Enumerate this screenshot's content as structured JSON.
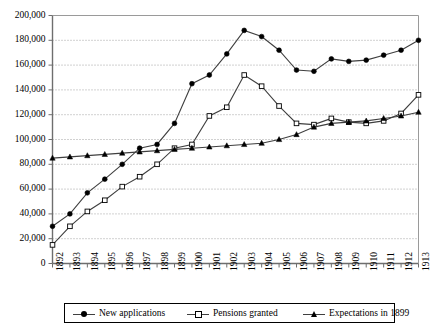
{
  "chart_data": {
    "type": "line",
    "title": "",
    "xlabel": "",
    "ylabel": "",
    "grid": true,
    "legend_position": "bottom",
    "ylim": [
      0,
      200000
    ],
    "ytick_step": 20000,
    "ytick_labels": [
      "200,000",
      "180,000",
      "160,000",
      "140,000",
      "120,000",
      "100,000",
      "80,000",
      "60,000",
      "40,000",
      "20,000",
      "0"
    ],
    "ytick_values": [
      200000,
      180000,
      160000,
      140000,
      120000,
      100000,
      80000,
      60000,
      40000,
      20000,
      0
    ],
    "categories": [
      "1892",
      "1893",
      "1894",
      "1895",
      "1896",
      "1897",
      "1898",
      "1899",
      "1900",
      "1901",
      "1902",
      "1903",
      "1904",
      "1905",
      "1906",
      "1907",
      "1908",
      "1909",
      "1910",
      "1911",
      "1912",
      "1913"
    ],
    "series": [
      {
        "name": "New applications",
        "marker": "filled-circle",
        "values": [
          30000,
          40000,
          57000,
          68000,
          80000,
          93000,
          96000,
          113000,
          145000,
          152000,
          169000,
          188000,
          183000,
          172000,
          156000,
          155000,
          165000,
          163000,
          164000,
          168000,
          172000,
          180000
        ]
      },
      {
        "name": "Pensions granted",
        "marker": "open-square",
        "values": [
          15000,
          30000,
          42000,
          51000,
          62000,
          70000,
          80000,
          93000,
          96000,
          119000,
          126000,
          152000,
          143000,
          127000,
          113000,
          112000,
          117000,
          114000,
          113000,
          115000,
          121000,
          136000
        ]
      },
      {
        "name": "Expectations in 1899",
        "marker": "filled-triangle",
        "values": [
          85000,
          86000,
          87000,
          88000,
          89000,
          90000,
          91000,
          92000,
          93000,
          94000,
          95000,
          96000,
          97000,
          100000,
          104000,
          110000,
          113000,
          114000,
          115000,
          117000,
          119000,
          122000
        ]
      }
    ]
  },
  "legend": {
    "entries": [
      {
        "label": "New applications",
        "marker": "filled-circle"
      },
      {
        "label": "Pensions granted",
        "marker": "open-square"
      },
      {
        "label": "Expectations in 1899",
        "marker": "filled-triangle"
      }
    ]
  }
}
